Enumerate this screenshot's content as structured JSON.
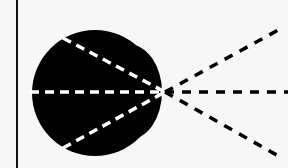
{
  "diagram": {
    "background": "#f7f7f7",
    "ink": "#000000",
    "inner_dash_color": "#ffffff",
    "vertical_line": {
      "x": 17,
      "y1": 0,
      "y2": 168
    },
    "focal_point": {
      "x": 165,
      "y": 92
    },
    "blob": {
      "fill": "#000000",
      "main_circle": {
        "cx": 95,
        "cy": 93,
        "r": 63
      },
      "right_lobe": {
        "cx": 128,
        "cy": 92,
        "rx": 34,
        "ry": 48
      }
    },
    "inner_rays": [
      {
        "name": "upper",
        "x1": 63,
        "y1": 38,
        "x2": 165,
        "y2": 92
      },
      {
        "name": "middle",
        "x1": 30,
        "y1": 92,
        "x2": 165,
        "y2": 92
      },
      {
        "name": "lower",
        "x1": 63,
        "y1": 148,
        "x2": 165,
        "y2": 92
      }
    ],
    "outer_rays": [
      {
        "name": "upper",
        "x1": 165,
        "y1": 92,
        "x2": 282,
        "y2": 28
      },
      {
        "name": "middle",
        "x1": 165,
        "y1": 92,
        "x2": 288,
        "y2": 92
      },
      {
        "name": "lower",
        "x1": 165,
        "y1": 92,
        "x2": 282,
        "y2": 158
      }
    ]
  }
}
